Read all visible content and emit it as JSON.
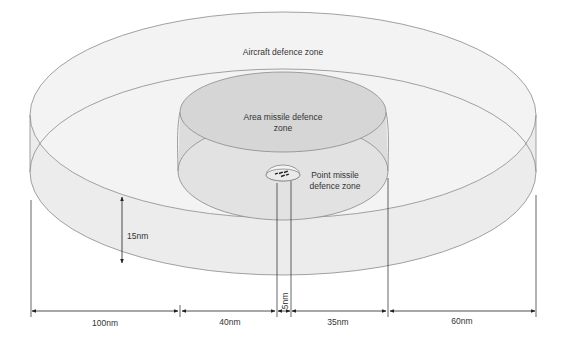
{
  "diagram": {
    "zones": [
      {
        "id": "aircraft",
        "label": "Aircraft defence zone",
        "fill": "#f0f0f0"
      },
      {
        "id": "area",
        "label": "Area missile defence zone",
        "label_line1": "Area missile defence",
        "label_line2": "zone",
        "fill": "#dedede"
      },
      {
        "id": "point",
        "label": "Point missile defence zone",
        "label_line1": "Point missile",
        "label_line2": "defence zone",
        "fill": "#e8e8e8"
      }
    ],
    "ship_icon": "warship-icon",
    "dimensions": {
      "height": "15nm",
      "segments": [
        "100nm",
        "40nm",
        "5nm",
        "35nm",
        "60nm"
      ]
    },
    "colors": {
      "outline": "#8a8a8a",
      "dimension_line": "#222222",
      "text": "#333333"
    }
  }
}
